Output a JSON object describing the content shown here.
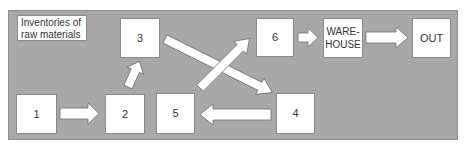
{
  "diagram": {
    "label": "Inventories of\nraw materials",
    "boxes": {
      "b1": "1",
      "b2": "2",
      "b3": "3",
      "b4": "4",
      "b5": "5",
      "b6": "6",
      "warehouse": "WARE-\nHOUSE",
      "out": "OUT"
    },
    "flow": [
      "1",
      "2",
      "3",
      "4",
      "5",
      "6",
      "WARE-HOUSE",
      "OUT"
    ],
    "colors": {
      "panel": "#a8a8a8",
      "box": "#ffffff",
      "arrow_fill": "#ffffff",
      "arrow_stroke": "#6f6f6f",
      "text": "#333333"
    }
  }
}
